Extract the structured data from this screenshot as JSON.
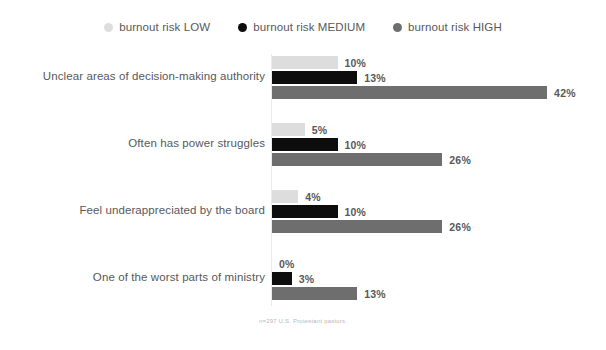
{
  "legend": {
    "position": "top-center",
    "items": [
      {
        "label": "burnout risk LOW",
        "color": "#dddddd",
        "marker": "circle-icon"
      },
      {
        "label": "burnout risk MEDIUM",
        "color": "#0d0d0d",
        "marker": "circle-icon"
      },
      {
        "label": "burnout risk HIGH",
        "color": "#6e6e6e",
        "marker": "circle-icon"
      }
    ]
  },
  "footnote": "n=297 U.S. Protestant pastors.",
  "chart_data": {
    "type": "bar",
    "orientation": "horizontal",
    "title": "",
    "subtitle": "",
    "xlabel": "",
    "ylabel": "",
    "xlim": [
      0,
      42
    ],
    "grid": false,
    "value_suffix": "%",
    "px_per_percent": 6.55,
    "categories": [
      "Unclear areas of decision-making authority",
      "Often has power struggles",
      "Feel underappreciated by the board",
      "One of the worst parts of ministry"
    ],
    "series": [
      {
        "name": "burnout risk LOW",
        "color": "#dddddd",
        "values": [
          10,
          5,
          4,
          0
        ]
      },
      {
        "name": "burnout risk MEDIUM",
        "color": "#0d0d0d",
        "values": [
          13,
          10,
          10,
          3
        ]
      },
      {
        "name": "burnout risk HIGH",
        "color": "#6e6e6e",
        "values": [
          42,
          26,
          26,
          13
        ]
      }
    ],
    "labels": [
      {
        "category": "Unclear areas of decision-making authority",
        "low": "10%",
        "medium": "13%",
        "high": "42%"
      },
      {
        "category": "Often has power struggles",
        "low": "5%",
        "medium": "10%",
        "high": "26%"
      },
      {
        "category": "Feel underappreciated by the board",
        "low": "4%",
        "medium": "10%",
        "high": "26%"
      },
      {
        "category": "One of the worst parts of ministry",
        "low": "0%",
        "medium": "3%",
        "high": "13%"
      }
    ]
  }
}
